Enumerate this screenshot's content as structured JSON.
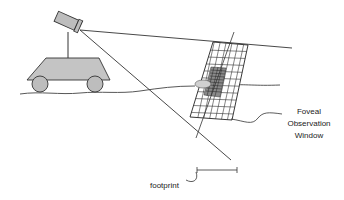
{
  "diagram": {
    "labels": {
      "window_line1": "Foveal",
      "window_line2": "Observation",
      "window_line3": "Window",
      "footprint": "footprint"
    },
    "elements": [
      "camera",
      "mast",
      "vehicle",
      "wheels",
      "ground",
      "view-rays",
      "foveal-grid",
      "footprint-bar"
    ],
    "colors": {
      "stroke": "#333333",
      "fill_gray": "#bdbdbd",
      "background": "#ffffff"
    }
  }
}
